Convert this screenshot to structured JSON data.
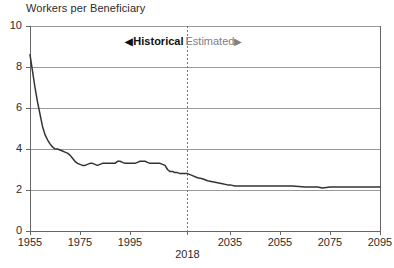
{
  "chart_data": {
    "type": "line",
    "title": "Workers per Beneficiary",
    "xlabel": "",
    "ylabel": "",
    "xlim": [
      1955,
      2095
    ],
    "ylim": [
      0,
      10
    ],
    "grid": true,
    "legend_position": "none",
    "yticks": [
      "0",
      "2",
      "4",
      "6",
      "8",
      "10"
    ],
    "ytick_values": [
      0,
      2,
      4,
      6,
      8,
      10
    ],
    "xticks": [
      "1955",
      "1975",
      "1995",
      "2018",
      "2035",
      "2055",
      "2075",
      "2095"
    ],
    "xtick_values": [
      1955,
      1975,
      1995,
      2018,
      2035,
      2055,
      2075,
      2095
    ],
    "annotations": [
      {
        "name": "divider-year",
        "value": 2018,
        "style": "dashed-vertical"
      },
      {
        "name": "historical-label",
        "text": "Historical",
        "arrow": "left"
      },
      {
        "name": "estimated-label",
        "text": "Estimated",
        "arrow": "right"
      }
    ],
    "series": [
      {
        "name": "Workers per Beneficiary",
        "x": [
          1955,
          1956,
          1957,
          1958,
          1959,
          1960,
          1961,
          1962,
          1963,
          1964,
          1965,
          1966,
          1967,
          1968,
          1969,
          1970,
          1971,
          1972,
          1973,
          1974,
          1975,
          1976,
          1977,
          1978,
          1979,
          1980,
          1981,
          1982,
          1983,
          1984,
          1985,
          1986,
          1987,
          1988,
          1989,
          1990,
          1991,
          1992,
          1993,
          1994,
          1995,
          1996,
          1997,
          1998,
          1999,
          2000,
          2001,
          2002,
          2003,
          2004,
          2005,
          2006,
          2007,
          2008,
          2009,
          2010,
          2011,
          2012,
          2013,
          2014,
          2015,
          2016,
          2017,
          2018,
          2020,
          2022,
          2024,
          2026,
          2028,
          2030,
          2032,
          2034,
          2035,
          2037,
          2040,
          2045,
          2050,
          2055,
          2060,
          2065,
          2070,
          2072,
          2075,
          2080,
          2085,
          2090,
          2095
        ],
        "y": [
          8.6,
          7.8,
          7.0,
          6.3,
          5.7,
          5.1,
          4.7,
          4.45,
          4.25,
          4.1,
          4.0,
          4.0,
          3.95,
          3.9,
          3.85,
          3.8,
          3.7,
          3.55,
          3.4,
          3.3,
          3.25,
          3.2,
          3.2,
          3.25,
          3.3,
          3.3,
          3.25,
          3.2,
          3.25,
          3.3,
          3.3,
          3.3,
          3.3,
          3.3,
          3.3,
          3.4,
          3.4,
          3.35,
          3.3,
          3.3,
          3.3,
          3.3,
          3.3,
          3.35,
          3.4,
          3.4,
          3.4,
          3.35,
          3.3,
          3.3,
          3.3,
          3.3,
          3.3,
          3.25,
          3.2,
          3.0,
          2.9,
          2.9,
          2.85,
          2.85,
          2.8,
          2.8,
          2.8,
          2.8,
          2.7,
          2.6,
          2.55,
          2.45,
          2.4,
          2.35,
          2.3,
          2.25,
          2.25,
          2.2,
          2.2,
          2.2,
          2.2,
          2.2,
          2.2,
          2.15,
          2.15,
          2.1,
          2.15,
          2.15,
          2.15,
          2.15,
          2.15
        ],
        "color": "#333333"
      }
    ],
    "colors": {
      "line": "#333333",
      "grid": "#999999",
      "axis": "#666666",
      "divider": "#777777",
      "historical_text": "#111111",
      "estimated_text": "#808080"
    }
  },
  "labels": {
    "arrow_left": "◀",
    "arrow_right": "▶"
  }
}
